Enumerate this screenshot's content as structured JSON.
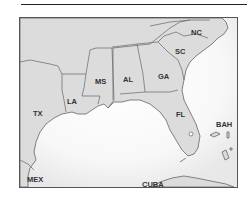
{
  "map": {
    "region": "Southeastern United States and Gulf of Mexico",
    "colors": {
      "land": "#dcdcdc",
      "water": "#ffffff",
      "border": "#666666",
      "label": "#333333"
    },
    "labels": [
      {
        "id": "nc",
        "text": "NC",
        "x": 191,
        "y": 35
      },
      {
        "id": "sc",
        "text": "SC",
        "x": 175,
        "y": 54
      },
      {
        "id": "ga",
        "text": "GA",
        "x": 160,
        "y": 79
      },
      {
        "id": "al",
        "text": "AL",
        "x": 128,
        "y": 79
      },
      {
        "id": "ms",
        "text": "MS",
        "x": 97,
        "y": 82
      },
      {
        "id": "la",
        "text": "LA",
        "x": 69,
        "y": 104
      },
      {
        "id": "tx",
        "text": "TX",
        "x": 35,
        "y": 116
      },
      {
        "id": "fl",
        "text": "FL",
        "x": 178,
        "y": 116
      },
      {
        "id": "bah",
        "text": "BAH",
        "x": 218,
        "y": 127
      },
      {
        "id": "mex",
        "text": "MEX",
        "x": 28,
        "y": 182
      },
      {
        "id": "cuba",
        "text": "CUBA",
        "x": 144,
        "y": 187
      }
    ]
  }
}
